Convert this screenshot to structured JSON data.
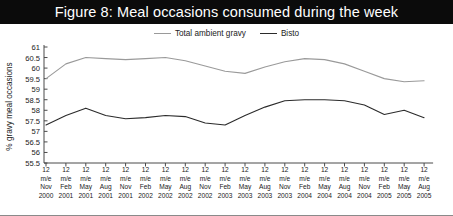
{
  "figure": {
    "title": "Figure 8: Meal occasions consumed during the week"
  },
  "legend": {
    "position": "top-center",
    "items": [
      {
        "label": "Total ambient gravy",
        "color": "#9a9a9a",
        "icon": "line-swatch-icon"
      },
      {
        "label": "Bisto",
        "color": "#2b2b2b",
        "icon": "line-swatch-icon"
      }
    ]
  },
  "chart_data": {
    "type": "line",
    "title": "Figure 8: Meal occasions consumed during the week",
    "xlabel": "",
    "ylabel": "% gravy meal occasions",
    "ylim": [
      55.5,
      61
    ],
    "ytick_labels": [
      "61",
      "60.5",
      "60",
      "59.5",
      "59",
      "58.5",
      "58",
      "57.5",
      "57",
      "56.5",
      "56",
      "55.5"
    ],
    "ytick_values": [
      61,
      60.5,
      60,
      59.5,
      59,
      58.5,
      58,
      57.5,
      57,
      56.5,
      56,
      55.5
    ],
    "grid": false,
    "categories": [
      "12 m/e Nov 2000",
      "12 m/e Feb 2001",
      "12 m/e May 2001",
      "12 m/e Aug 2001",
      "12 m/e Nov 2001",
      "12 m/e Feb 2002",
      "12 m/e May 2002",
      "12 m/e Aug 2002",
      "12 m/e Nov 2002",
      "12 m/e Feb 2003",
      "12 m/e May 2003",
      "12 m/e Aug 2003",
      "12 m/e Nov 2003",
      "12 m/e Feb 2004",
      "12 m/e May 2004",
      "12 m/e Aug 2004",
      "12 m/e Nov 2004",
      "12 m/e Feb 2005",
      "12 m/e May 2005",
      "12 m/e Aug 2005"
    ],
    "xtick_lines": [
      {
        "period": "12",
        "basis": "m/e",
        "month": "Nov",
        "year": "2000"
      },
      {
        "period": "12",
        "basis": "m/e",
        "month": "Feb",
        "year": "2001"
      },
      {
        "period": "12",
        "basis": "m/e",
        "month": "May",
        "year": "2001"
      },
      {
        "period": "12",
        "basis": "m/e",
        "month": "Aug",
        "year": "2001"
      },
      {
        "period": "12",
        "basis": "m/e",
        "month": "Nov",
        "year": "2001"
      },
      {
        "period": "12",
        "basis": "m/e",
        "month": "Feb",
        "year": "2002"
      },
      {
        "period": "12",
        "basis": "m/e",
        "month": "May",
        "year": "2002"
      },
      {
        "period": "12",
        "basis": "m/e",
        "month": "Aug",
        "year": "2002"
      },
      {
        "period": "12",
        "basis": "m/e",
        "month": "Nov",
        "year": "2002"
      },
      {
        "period": "12",
        "basis": "m/e",
        "month": "Feb",
        "year": "2003"
      },
      {
        "period": "12",
        "basis": "m/e",
        "month": "May",
        "year": "2003"
      },
      {
        "period": "12",
        "basis": "m/e",
        "month": "Aug",
        "year": "2003"
      },
      {
        "period": "12",
        "basis": "m/e",
        "month": "Nov",
        "year": "2003"
      },
      {
        "period": "12",
        "basis": "m/e",
        "month": "Feb",
        "year": "2004"
      },
      {
        "period": "12",
        "basis": "m/e",
        "month": "May",
        "year": "2004"
      },
      {
        "period": "12",
        "basis": "m/e",
        "month": "Aug",
        "year": "2004"
      },
      {
        "period": "12",
        "basis": "m/e",
        "month": "Nov",
        "year": "2004"
      },
      {
        "period": "12",
        "basis": "m/e",
        "month": "Feb",
        "year": "2005"
      },
      {
        "period": "12",
        "basis": "m/e",
        "month": "May",
        "year": "2005"
      },
      {
        "period": "12",
        "basis": "m/e",
        "month": "Aug",
        "year": "2005"
      }
    ],
    "series": [
      {
        "name": "Total ambient gravy",
        "color": "#9a9a9a",
        "values": [
          59.5,
          60.2,
          60.5,
          60.45,
          60.4,
          60.45,
          60.5,
          60.35,
          60.1,
          59.85,
          59.75,
          60.05,
          60.3,
          60.45,
          60.4,
          60.2,
          59.85,
          59.5,
          59.35,
          59.4
        ]
      },
      {
        "name": "Bisto",
        "color": "#2b2b2b",
        "values": [
          57.3,
          57.75,
          58.1,
          57.75,
          57.6,
          57.65,
          57.75,
          57.7,
          57.4,
          57.3,
          57.75,
          58.15,
          58.45,
          58.5,
          58.5,
          58.45,
          58.25,
          57.8,
          58.0,
          57.65
        ]
      }
    ]
  }
}
